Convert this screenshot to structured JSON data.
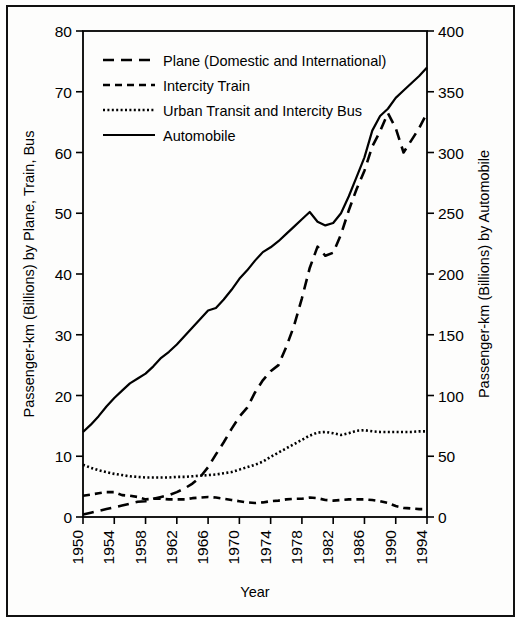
{
  "figure": {
    "left_axis_title": "Passenger-km (Billions) by Plane, Train, Bus",
    "right_axis_title": "Passenger-km (Billions) by Automobile",
    "x_axis_title": "Year"
  },
  "chart_data": {
    "type": "line",
    "title": "",
    "xlabel": "Year",
    "ylabel": "Passenger-km (Billions) by Plane, Train, Bus",
    "ylabel_right": "Passenger-km (Billions) by Automobile",
    "xlim": [
      1950,
      1994
    ],
    "ylim": [
      0,
      80
    ],
    "ylim_right": [
      0,
      400
    ],
    "grid": false,
    "legend_position": "top-left-inside",
    "xticks": [
      1950,
      1954,
      1958,
      1962,
      1966,
      1970,
      1974,
      1978,
      1982,
      1986,
      1990,
      1994
    ],
    "xtick_labels": [
      "1950",
      "1954",
      "1958",
      "1962",
      "1966",
      "1970",
      "1974",
      "1978",
      "1982",
      "1986",
      "1990",
      "1994"
    ],
    "yticks": [
      0,
      10,
      20,
      30,
      40,
      50,
      60,
      70,
      80
    ],
    "ytick_labels": [
      "0",
      "10",
      "20",
      "30",
      "40",
      "50",
      "60",
      "70",
      "80"
    ],
    "yticks_right": [
      0,
      50,
      100,
      150,
      200,
      250,
      300,
      350,
      400
    ],
    "ytick_labels_right": [
      "0",
      "50",
      "100",
      "150",
      "200",
      "250",
      "300",
      "350",
      "400"
    ],
    "x": [
      1950,
      1951,
      1952,
      1953,
      1954,
      1955,
      1956,
      1957,
      1958,
      1959,
      1960,
      1961,
      1962,
      1963,
      1964,
      1965,
      1966,
      1967,
      1968,
      1969,
      1970,
      1971,
      1972,
      1973,
      1974,
      1975,
      1976,
      1977,
      1978,
      1979,
      1980,
      1981,
      1982,
      1983,
      1984,
      1985,
      1986,
      1987,
      1988,
      1989,
      1990,
      1991,
      1992,
      1993,
      1994
    ],
    "series": [
      {
        "name": "Plane (Domestic and International)",
        "axis": "left",
        "style": "long-dash",
        "values": [
          0.4,
          0.7,
          1.0,
          1.3,
          1.6,
          1.9,
          2.2,
          2.5,
          2.6,
          3.0,
          3.3,
          3.6,
          4.1,
          4.7,
          5.5,
          6.6,
          8.2,
          10.3,
          12.3,
          14.5,
          16.5,
          18.0,
          20.5,
          22.5,
          24.0,
          25.0,
          28.0,
          31.5,
          36.0,
          41.0,
          44.5,
          43.0,
          43.5,
          46.5,
          50.5,
          54.0,
          57.0,
          61.0,
          63.5,
          66.5,
          64.0,
          60.0,
          62.0,
          64.0,
          66.5
        ]
      },
      {
        "name": "Intercity Train",
        "axis": "left",
        "style": "medium-dash",
        "values": [
          3.5,
          3.7,
          3.9,
          4.1,
          4.1,
          3.6,
          3.5,
          3.3,
          2.9,
          3.0,
          3.0,
          2.9,
          2.9,
          2.9,
          3.1,
          3.2,
          3.3,
          3.2,
          3.0,
          2.8,
          2.6,
          2.4,
          2.3,
          2.4,
          2.6,
          2.7,
          2.9,
          3.0,
          3.0,
          3.2,
          3.1,
          2.8,
          2.7,
          2.8,
          2.9,
          2.9,
          2.9,
          2.8,
          2.6,
          2.3,
          1.8,
          1.5,
          1.4,
          1.3,
          1.3
        ]
      },
      {
        "name": "Urban Transit and Intercity Bus",
        "axis": "left",
        "style": "dotted",
        "values": [
          8.6,
          8.1,
          7.7,
          7.4,
          7.1,
          6.9,
          6.7,
          6.6,
          6.5,
          6.5,
          6.5,
          6.5,
          6.6,
          6.6,
          6.7,
          6.8,
          6.9,
          7.0,
          7.2,
          7.4,
          7.8,
          8.2,
          8.6,
          9.1,
          9.9,
          10.6,
          11.3,
          12.0,
          12.7,
          13.4,
          13.9,
          14.0,
          13.8,
          13.5,
          13.8,
          14.2,
          14.3,
          14.1,
          14.0,
          14.0,
          14.0,
          14.0,
          14.0,
          14.1,
          14.1
        ]
      },
      {
        "name": "Automobile",
        "axis": "right",
        "style": "solid",
        "values": [
          70,
          76,
          83,
          91,
          98,
          104,
          110,
          114,
          118,
          124,
          131,
          136,
          142,
          149,
          156,
          163,
          170,
          172,
          179,
          187,
          196,
          203,
          211,
          218,
          222,
          227,
          233,
          239,
          245,
          251,
          243,
          240,
          242,
          250,
          264,
          280,
          296,
          318,
          330,
          336,
          345,
          351,
          357,
          363,
          370
        ]
      }
    ]
  },
  "legend": {
    "items": [
      {
        "label": "Plane (Domestic and International)",
        "style": "long-dash"
      },
      {
        "label": "Intercity Train",
        "style": "medium-dash"
      },
      {
        "label": "Urban Transit and Intercity Bus",
        "style": "dotted"
      },
      {
        "label": "Automobile",
        "style": "solid"
      }
    ]
  }
}
